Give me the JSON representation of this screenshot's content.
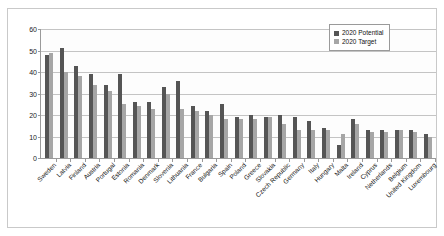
{
  "chart_data": {
    "type": "bar",
    "title": "",
    "xlabel": "",
    "ylabel": "",
    "ylim": [
      0,
      60
    ],
    "yticks": [
      0,
      10,
      20,
      30,
      40,
      50,
      60
    ],
    "grid": true,
    "legend_position": "top-right",
    "categories": [
      "Sweden",
      "Latvia",
      "Finland",
      "Austria",
      "Portugal",
      "Estonia",
      "Romania",
      "Denmark",
      "Slovenia",
      "Lithuania",
      "France",
      "Bulgaria",
      "Spain",
      "Poland",
      "Greece",
      "Slovakia",
      "Czech Republic",
      "Germany",
      "Italy",
      "Hungary",
      "Malta",
      "Ireland",
      "Cyprus",
      "Netherlands",
      "Belgium",
      "United Kingdom",
      "Luxembourg"
    ],
    "series": [
      {
        "name": "2020 Potential",
        "color": "#555555",
        "values": [
          48,
          51,
          43,
          39,
          34,
          39,
          26,
          26,
          33,
          36,
          24,
          22,
          25,
          19,
          20,
          19,
          20,
          19,
          17,
          14,
          6,
          18,
          13,
          13,
          13,
          13,
          11
        ]
      },
      {
        "name": "2020 Target",
        "color": "#a6a6a6",
        "values": [
          49,
          40,
          38,
          34,
          31,
          25,
          24,
          23,
          30,
          23,
          22,
          20,
          18,
          18,
          18,
          19,
          16,
          13,
          13,
          13,
          11,
          16,
          12,
          12,
          13,
          12,
          10
        ]
      }
    ]
  },
  "legend": {
    "items": [
      {
        "label": "2020 Potential"
      },
      {
        "label": "2020 Target"
      }
    ]
  }
}
